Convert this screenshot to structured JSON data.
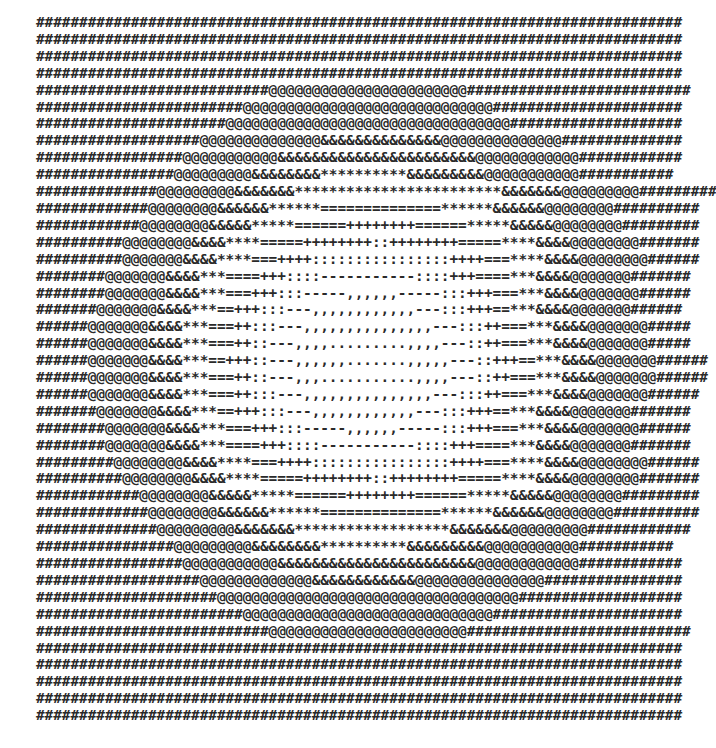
{
  "art": {
    "lines": [
      "###########################################################################",
      "###########################################################################",
      "###########################################################################",
      "###########################################################################",
      "###########################@@@@@@@@@@@@@@@@@@@@@@@##########################",
      "########################@@@@@@@@@@@@@@@@@@@@@@@@@@@@@######################",
      "######################@@@@@@@@@@@@@@@@@@@@@@@@@@@@@@@@@####################",
      "###################@@@@@@@@@@@@@@&&&&&&&&&&&&&&@@@@@@@@@@@@@@##############",
      "#################@@@@@@@@@@@&&&&&&&&&&&&&&&&&&&&&&&@@@@@@@@@@@@############",
      "################@@@@@@@@@&&&&&&&&**********&&&&&&&&&@@@@@@@@@@@###########",
      "##############@@@@@@@@@&&&&&&&************************&&&&&&&@@@@@@@@@############",
      "#############@@@@@@@@&&&&&&******==============******&&&&&&@@@@@@@@##########",
      "############@@@@@@@@&&&&&*****======++++++++======*****&&&&&@@@@@@@@#########",
      "##########@@@@@@@@&&&&****=====++++++++::++++++++=====****&&&&@@@@@@@@#######",
      "##########@@@@@@@&&&&****===++++::::::::::::::::++++===****&&&&@@@@@@@@######",
      "########@@@@@@@&&&&***====+++::::-----------::::+++====***&&&&@@@@@@@#######",
      "########@@@@@@@&&&&***===+++:::-----,,,,,,-----:::+++===***&&&&@@@@@@@######",
      "#######@@@@@@@&&&&***==+++:::---,,,,,,,,,,,,---:::+++==***&&&&@@@@@@@######",
      "######@@@@@@@&&&&***===++:::---,,,,,,,,,,,,,,,---:::++===***&&&&@@@@@@@#####",
      "######@@@@@@@&&&&***===++::---,,,,.........,,,,---::++===***&&&&@@@@@@@#####",
      "######@@@@@@@&&&&***==+++::---,,,,,,.......,,,,,---::+++==***&&&&@@@@@@@######",
      "######@@@@@@@&&&&***===++::---,,,...........,,,,---::++===***&&&&@@@@@@@######",
      "######@@@@@@@&&&&***===++:::---,,,,,,,,,,,,,,,---:::++===***&&&&@@@@@@@######",
      "#######@@@@@@@&&&&***==+++:::---,,,,,,,,,,,,---:::+++==***&&&&@@@@@@@#######",
      "########@@@@@@@&&&&***===+++:::-----,,,,,,-----:::+++===***&&&&@@@@@@@######",
      "########@@@@@@@&&&&***====+++::::-----------::::+++====***&&&&@@@@@@@#######",
      "#########@@@@@@@@&&&&****===++++::::::::::::::::++++===****&&&&@@@@@@@@######",
      "##########@@@@@@@@&&&&****=====++++++++::++++++++=====****&&&&@@@@@@@@#######",
      "############@@@@@@@@&&&&&*****======++++++++======*****&&&&&@@@@@@@@#########",
      "#############@@@@@@@@&&&&&&******==============******&&&&&&@@@@@@@@##########",
      "##############@@@@@@@@@&&&&&&&******************&&&&&&&@@@@@@@@@############",
      "################@@@@@@@@@&&&&&&&&**********&&&&&&&&&@@@@@@@@@@@###########",
      "#################@@@@@@@@@@@&&&&&&&&&&&&&&&&&&&&&&&@@@@@@@@@@@@############",
      "###################@@@@@@@@@@@@@&&&&&&&&&&&&@@@@@@@@@@@@@@@################",
      "#####################@@@@@@@@@@@@@@@@@@@@@@@@@@@@@@@@@@@###################",
      "########################@@@@@@@@@@@@@@@@@@@@@@@@@@@@@######################",
      "###########################@@@@@@@@@@@@@@@@@@@@@@@##########################",
      "###########################################################################",
      "###########################################################################",
      "###########################################################################",
      "###########################################################################",
      "###########################################################################"
    ]
  }
}
